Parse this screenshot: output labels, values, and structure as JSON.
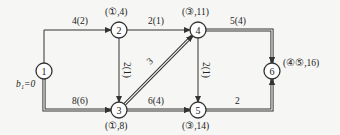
{
  "diagram": {
    "type": "network",
    "colors": {
      "line": "#333333",
      "background": "#f6f6f4",
      "node_fill": "#ffffff"
    },
    "nodes": [
      {
        "id": "1",
        "label": "1",
        "x": 44,
        "y": 71,
        "annotation": "b₁=0",
        "ann_x": 16,
        "ann_y": 87
      },
      {
        "id": "2",
        "label": "2",
        "x": 119,
        "y": 30,
        "annotation": "(①,4)",
        "ann_x": 105,
        "ann_y": 15
      },
      {
        "id": "3",
        "label": "3",
        "x": 119,
        "y": 110,
        "annotation": "(①,8)",
        "ann_x": 105,
        "ann_y": 129
      },
      {
        "id": "4",
        "label": "4",
        "x": 198,
        "y": 30,
        "annotation": "(③,11)",
        "ann_x": 182,
        "ann_y": 15
      },
      {
        "id": "5",
        "label": "5",
        "x": 198,
        "y": 110,
        "annotation": "(③,14)",
        "ann_x": 182,
        "ann_y": 129
      },
      {
        "id": "6",
        "label": "6",
        "x": 272,
        "y": 71,
        "annotation": "(④⑤,16)",
        "ann_x": 283,
        "ann_y": 66
      }
    ],
    "edges": [
      {
        "from": "1",
        "to": "2",
        "label": "4(2)",
        "double": false,
        "label_x": 72,
        "label_y": 24
      },
      {
        "from": "1",
        "to": "3",
        "label": "8(6)",
        "double": true,
        "label_x": 72,
        "label_y": 104
      },
      {
        "from": "2",
        "to": "4",
        "label": "2(1)",
        "double": false,
        "label_x": 148,
        "label_y": 24
      },
      {
        "from": "2",
        "to": "3",
        "label": "2(1)",
        "double": false,
        "label_x": 124,
        "label_y": 62,
        "vertical": true
      },
      {
        "from": "3",
        "to": "4",
        "label": "3",
        "double": true,
        "label_x": 150,
        "label_y": 65
      },
      {
        "from": "3",
        "to": "5",
        "label": "6(4)",
        "double": true,
        "label_x": 148,
        "label_y": 104
      },
      {
        "from": "4",
        "to": "5",
        "label": "2(1)",
        "double": false,
        "label_x": 203,
        "label_y": 62,
        "vertical": true
      },
      {
        "from": "4",
        "to": "6",
        "label": "5(4)",
        "double": true,
        "label_x": 230,
        "label_y": 24
      },
      {
        "from": "5",
        "to": "6",
        "label": "2",
        "double": true,
        "label_x": 235,
        "label_y": 104
      }
    ]
  }
}
